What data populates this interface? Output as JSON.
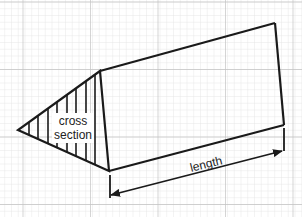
{
  "diagram": {
    "labels": {
      "cross_section_line1": "cross",
      "cross_section_line2": "section",
      "length": "length"
    },
    "colors": {
      "background": "#ffffff",
      "grid_minor": "#e2e2e2",
      "grid_major": "#c8c8c8",
      "stroke": "#1a1a1a"
    },
    "shape": {
      "type": "triangular-prism",
      "cross_section_vertices": [
        [
          100,
          71
        ],
        [
          18,
          130
        ],
        [
          109,
          171
        ]
      ],
      "far_top": [
        275,
        23
      ],
      "far_bottom": [
        284,
        125
      ]
    },
    "dimension": {
      "start": [
        109,
        194
      ],
      "end": [
        283,
        126
      ]
    }
  }
}
